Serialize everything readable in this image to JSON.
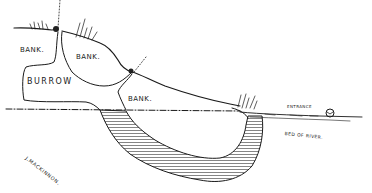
{
  "diagram": {
    "type": "cross-section sketch of a burrow in a river bank",
    "labels": {
      "bank_upper_left": "BANK.",
      "bank_middle": "BANK.",
      "burrow": "BURROW",
      "bank_lower": "BANK.",
      "entrance": "ENTRANCE",
      "bed_of_river": "BED OF RIVER.",
      "signature": "J.MACKINNON."
    },
    "colors": {
      "ink": "#1a1a1a",
      "paper": "#ffffff"
    }
  }
}
